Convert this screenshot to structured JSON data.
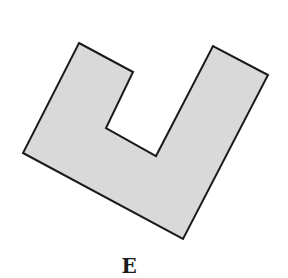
{
  "figure": {
    "label": "E",
    "shape": "rotated U-shaped polygon",
    "fill": "#d9d9d9",
    "stroke": "#1a1a1a",
    "points": "79,43 133,72 106,128 156,156 213,46 268,75 183,239 23,153"
  }
}
